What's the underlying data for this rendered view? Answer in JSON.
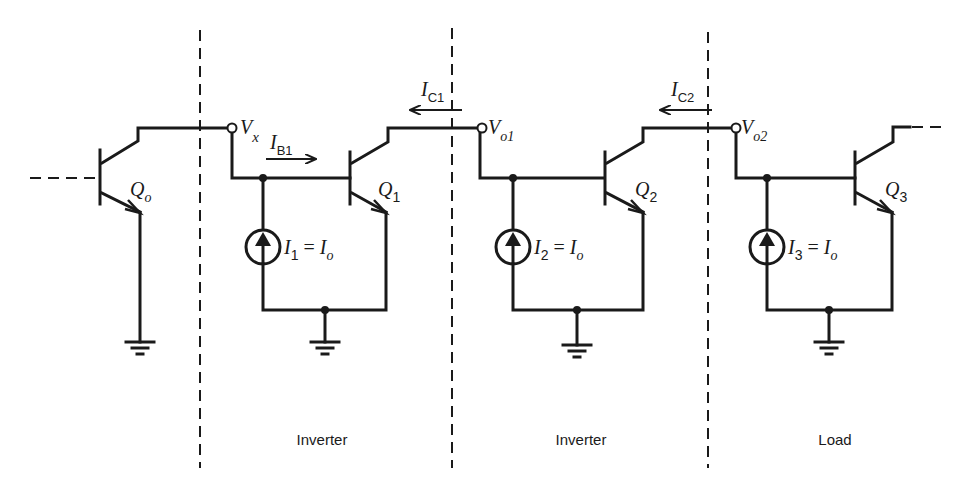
{
  "diagram": {
    "type": "circuit-schematic",
    "dividers_x": [
      200,
      452,
      708
    ],
    "sections": [
      {
        "label": "Inverter"
      },
      {
        "label": "Inverter"
      },
      {
        "label": "Load"
      }
    ],
    "transistors": [
      {
        "name": "Q",
        "sub": "o"
      },
      {
        "name": "Q",
        "sub": "1"
      },
      {
        "name": "Q",
        "sub": "2"
      },
      {
        "name": "Q",
        "sub": "3"
      }
    ],
    "nodes": [
      {
        "name": "V",
        "sub": "x"
      },
      {
        "name": "V",
        "sub": "o1"
      },
      {
        "name": "V",
        "sub": "o2"
      }
    ],
    "currents": {
      "ib1": {
        "name": "I",
        "sub": "B1"
      },
      "ic1": {
        "name": "I",
        "sub": "C1"
      },
      "ic2": {
        "name": "I",
        "sub": "C2"
      }
    },
    "sources": [
      {
        "name": "I",
        "sub": "1",
        "eq": " = ",
        "val": "I",
        "val_sub": "o"
      },
      {
        "name": "I",
        "sub": "2",
        "eq": " = ",
        "val": "I",
        "val_sub": "o"
      },
      {
        "name": "I",
        "sub": "3",
        "eq": " = ",
        "val": "I",
        "val_sub": "o"
      }
    ]
  }
}
